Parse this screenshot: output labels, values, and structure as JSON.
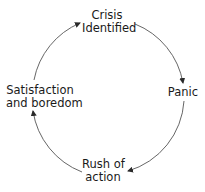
{
  "diagram": {
    "type": "cycle",
    "nodes": [
      {
        "id": "crisis",
        "lines": [
          "Crisis",
          "Identified"
        ]
      },
      {
        "id": "panic",
        "lines": [
          "Panic"
        ]
      },
      {
        "id": "rush",
        "lines": [
          "Rush of",
          "action"
        ]
      },
      {
        "id": "satisfaction",
        "lines": [
          "Satisfaction",
          "and boredom"
        ]
      }
    ],
    "edges": [
      {
        "from": "Crisis Identified",
        "to": "Panic"
      },
      {
        "from": "Panic",
        "to": "Rush of action"
      },
      {
        "from": "Rush of action",
        "to": "Satisfaction and boredom"
      },
      {
        "from": "Satisfaction and boredom",
        "to": "Crisis Identified"
      }
    ],
    "colors": {
      "line": "#3a3a3a",
      "text": "#1a1a1a",
      "background": "#ffffff"
    }
  }
}
